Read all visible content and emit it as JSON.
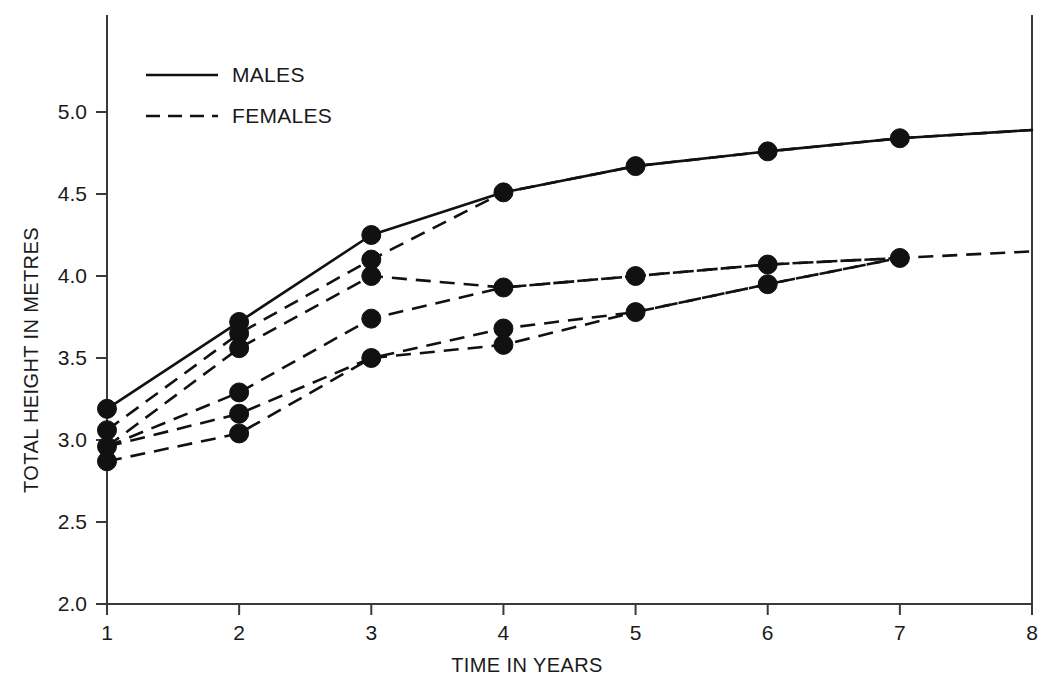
{
  "chart_data": {
    "type": "line",
    "title": "",
    "xlabel": "TIME IN YEARS",
    "ylabel": "TOTAL HEIGHT IN METRES",
    "xlim": [
      1,
      8
    ],
    "ylim": [
      2.0,
      5.0
    ],
    "xticks": [
      "1",
      "2",
      "3",
      "4",
      "5",
      "6",
      "7",
      "8"
    ],
    "yticks": [
      "2.0",
      "2.5",
      "3.0",
      "3.5",
      "4.0",
      "4.5",
      "5.0"
    ],
    "grid": false,
    "legend_position": "top-left",
    "legend": [
      {
        "label": "MALES",
        "style": "solid"
      },
      {
        "label": "FEMALES",
        "style": "dashed"
      }
    ],
    "series": [
      {
        "name": "MALES",
        "style": "solid",
        "x": [
          1,
          2,
          3,
          4,
          5,
          6,
          7,
          8
        ],
        "values": [
          3.19,
          3.72,
          4.25,
          4.51,
          4.67,
          4.76,
          4.84,
          4.89
        ]
      },
      {
        "name": "FEMALES-1",
        "style": "dashed",
        "x": [
          1,
          2,
          3,
          4,
          5,
          6,
          7,
          8
        ],
        "values": [
          3.06,
          3.65,
          4.1,
          4.51,
          4.67,
          4.76,
          4.84,
          4.89
        ]
      },
      {
        "name": "FEMALES-2",
        "style": "dashed",
        "x": [
          1,
          2,
          3,
          4,
          5,
          6,
          7,
          8
        ],
        "values": [
          2.96,
          3.56,
          4.0,
          3.93,
          4.0,
          4.07,
          4.11,
          4.15
        ]
      },
      {
        "name": "FEMALES-3",
        "style": "dashed",
        "x": [
          1,
          2,
          3,
          4,
          5,
          6,
          7
        ],
        "values": [
          2.96,
          3.29,
          3.74,
          3.93,
          4.0,
          4.07,
          4.11
        ]
      },
      {
        "name": "FEMALES-4",
        "style": "dashed",
        "x": [
          1,
          2,
          3,
          4,
          5,
          6,
          7
        ],
        "values": [
          2.96,
          3.16,
          3.5,
          3.68,
          3.78,
          3.95,
          4.11
        ]
      },
      {
        "name": "FEMALES-5",
        "style": "dashed",
        "x": [
          1,
          2,
          3,
          4,
          5,
          6,
          7
        ],
        "values": [
          2.87,
          3.04,
          3.5,
          3.58,
          3.78,
          3.95,
          4.11
        ]
      }
    ],
    "markers": [
      {
        "x": 1,
        "y": 3.19
      },
      {
        "x": 1,
        "y": 3.06
      },
      {
        "x": 1,
        "y": 2.96
      },
      {
        "x": 1,
        "y": 2.87
      },
      {
        "x": 2,
        "y": 3.72
      },
      {
        "x": 2,
        "y": 3.65
      },
      {
        "x": 2,
        "y": 3.56
      },
      {
        "x": 2,
        "y": 3.29
      },
      {
        "x": 2,
        "y": 3.16
      },
      {
        "x": 2,
        "y": 3.04
      },
      {
        "x": 3,
        "y": 4.25
      },
      {
        "x": 3,
        "y": 4.1
      },
      {
        "x": 3,
        "y": 4.0
      },
      {
        "x": 3,
        "y": 3.74
      },
      {
        "x": 3,
        "y": 3.5
      },
      {
        "x": 4,
        "y": 4.51
      },
      {
        "x": 4,
        "y": 3.93
      },
      {
        "x": 4,
        "y": 3.68
      },
      {
        "x": 4,
        "y": 3.58
      },
      {
        "x": 5,
        "y": 4.67
      },
      {
        "x": 5,
        "y": 4.0
      },
      {
        "x": 5,
        "y": 3.78
      },
      {
        "x": 6,
        "y": 4.76
      },
      {
        "x": 6,
        "y": 4.07
      },
      {
        "x": 6,
        "y": 3.95
      },
      {
        "x": 7,
        "y": 4.84
      },
      {
        "x": 7,
        "y": 4.11
      }
    ]
  }
}
